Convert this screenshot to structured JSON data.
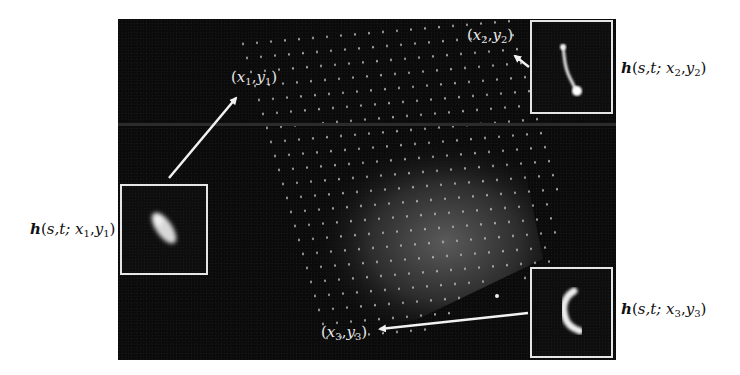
{
  "figure": {
    "background": "#ffffff",
    "scene_color": "#0b0b0b",
    "frame_color": "#e6e6e6",
    "arrow_color": "#f2f2f2"
  },
  "points": [
    {
      "id": "p1",
      "label_var_x": "x",
      "label_sub_x": "1",
      "label_var_y": "y",
      "label_sub_y": "1"
    },
    {
      "id": "p2",
      "label_var_x": "x",
      "label_sub_x": "2",
      "label_var_y": "y",
      "label_sub_y": "2"
    },
    {
      "id": "p3",
      "label_var_x": "x",
      "label_sub_x": "3",
      "label_var_y": "y",
      "label_sub_y": "3"
    }
  ],
  "psf_labels": [
    {
      "id": "h1",
      "func": "h",
      "args": "s,t; ",
      "var_x": "x",
      "sub_x": "1",
      "var_y": "y",
      "sub_y": "1"
    },
    {
      "id": "h2",
      "func": "h",
      "args": "s,t; ",
      "var_x": "x",
      "sub_x": "2",
      "var_y": "y",
      "sub_y": "2"
    },
    {
      "id": "h3",
      "func": "h",
      "args": "s,t; ",
      "var_x": "x",
      "sub_x": "3",
      "var_y": "y",
      "sub_y": "3"
    }
  ],
  "punct": {
    "open": "(",
    "comma": ",",
    "close": ")"
  },
  "insets": [
    {
      "id": "inset-1",
      "psf_shape": "elongated-blob"
    },
    {
      "id": "inset-2",
      "psf_shape": "thin-streak"
    },
    {
      "id": "inset-3",
      "psf_shape": "crescent"
    }
  ]
}
